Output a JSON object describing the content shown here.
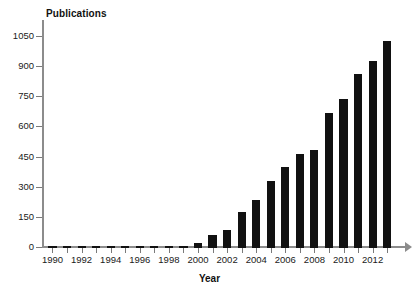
{
  "chart_data": {
    "type": "bar",
    "title": "",
    "ylabel": "Publications",
    "xlabel": "Year",
    "categories": [
      1990,
      1991,
      1992,
      1993,
      1994,
      1995,
      1996,
      1997,
      1998,
      1999,
      2000,
      2001,
      2002,
      2003,
      2004,
      2005,
      2006,
      2007,
      2008,
      2009,
      2010,
      2011,
      2012,
      2013
    ],
    "values": [
      3,
      2,
      3,
      3,
      2,
      3,
      3,
      4,
      5,
      12,
      25,
      65,
      90,
      180,
      240,
      335,
      405,
      470,
      490,
      670,
      740,
      865,
      930,
      1030
    ],
    "ylim": [
      0,
      1125
    ],
    "y_ticks": [
      0,
      150,
      300,
      450,
      600,
      750,
      900,
      1050
    ],
    "y_tick_labels": [
      "0",
      "150",
      "300",
      "450",
      "600",
      "750",
      "900",
      "1050"
    ],
    "x_tick_labels": [
      "1990",
      "1992",
      "1994",
      "1996",
      "1998",
      "2000",
      "2002",
      "2004",
      "2006",
      "2008",
      "2010",
      "2012"
    ],
    "x_tick_years": [
      1990,
      1992,
      1994,
      1996,
      1998,
      2000,
      2002,
      2004,
      2006,
      2008,
      2010,
      2012
    ],
    "grid": false,
    "legend": null,
    "bar_color": "#111111",
    "axis_color": "#8c8c8c",
    "text_color": "#1a1a1a"
  }
}
